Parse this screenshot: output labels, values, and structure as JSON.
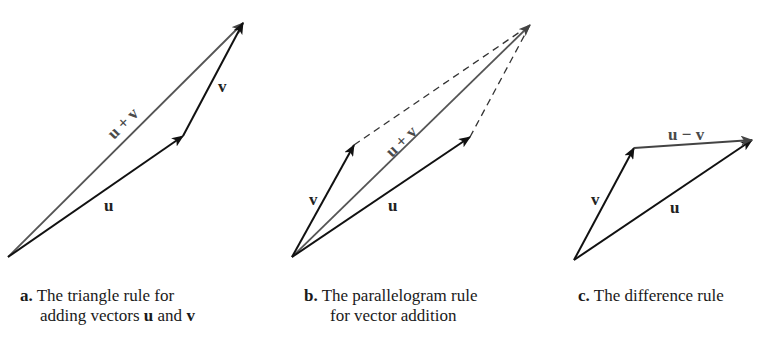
{
  "panels": {
    "a": {
      "labels": {
        "sum": "u + v",
        "v": "v",
        "u": "u"
      },
      "caption": {
        "letter": "a.",
        "line1": "The triangle rule for",
        "line2_pre": "adding vectors ",
        "u": "u",
        "and": " and ",
        "v": "v"
      }
    },
    "b": {
      "labels": {
        "sum": "u + v",
        "v": "v",
        "u": "u"
      },
      "caption": {
        "letter": "b.",
        "line1": "The parallelogram rule",
        "line2": "for vector addition"
      }
    },
    "c": {
      "labels": {
        "diff": "u − v",
        "v": "v",
        "u": "u"
      },
      "caption": {
        "letter": "c.",
        "line1": "The difference rule"
      }
    }
  },
  "colors": {
    "vector": "#111111",
    "resultant": "#555555",
    "dashed": "#333333"
  }
}
